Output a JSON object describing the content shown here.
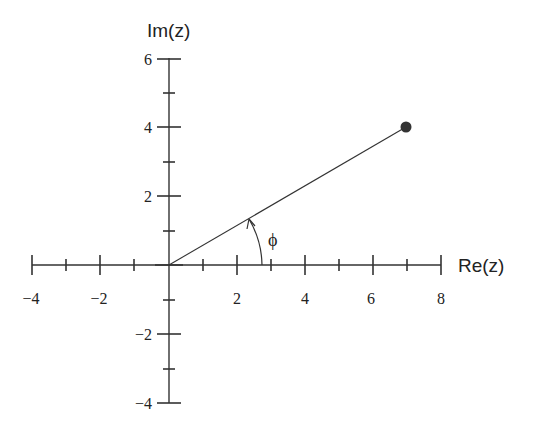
{
  "diagram": {
    "x_axis": {
      "label": "Re(z)",
      "range": [
        -4,
        8
      ],
      "major_ticks": [
        -4,
        -2,
        0,
        2,
        4,
        6,
        8
      ],
      "tick_labels": [
        "−4",
        "−2",
        "2",
        "4",
        "6",
        "8"
      ],
      "minor_ticks": [
        -3,
        -1,
        1,
        3,
        5,
        7
      ]
    },
    "y_axis": {
      "label": "Im(z)",
      "range": [
        -4,
        6
      ],
      "major_ticks": [
        -4,
        -2,
        0,
        2,
        4,
        6
      ],
      "tick_labels": [
        "6",
        "4",
        "2",
        "−2",
        "−4"
      ],
      "minor_ticks": [
        -3,
        -1,
        1,
        3,
        5
      ]
    },
    "point": {
      "re": 7,
      "im": 4,
      "color": "#333333"
    },
    "angle_label": "ϕ",
    "colors": {
      "ink": "#333333",
      "background": "#ffffff"
    }
  }
}
